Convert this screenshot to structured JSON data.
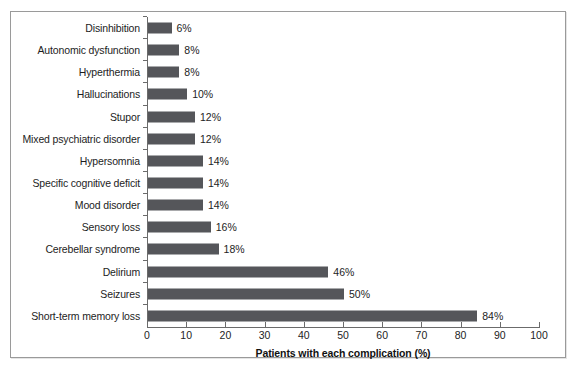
{
  "chart_data": {
    "type": "bar",
    "orientation": "horizontal",
    "title": "",
    "xlabel": "Patients with each complication (%)",
    "ylabel": "",
    "xlim": [
      0,
      100
    ],
    "xticks": [
      0,
      10,
      20,
      30,
      40,
      50,
      60,
      70,
      80,
      90,
      100
    ],
    "grid": false,
    "legend": null,
    "bar_color": "#55565a",
    "categories": [
      "Disinhibition",
      "Autonomic dysfunction",
      "Hyperthermia",
      "Hallucinations",
      "Stupor",
      "Mixed psychiatric disorder",
      "Hypersomnia",
      "Specific cognitive deficit",
      "Mood disorder",
      "Sensory loss",
      "Cerebellar syndrome",
      "Delirium",
      "Seizures",
      "Short-term memory loss"
    ],
    "values": [
      6,
      8,
      8,
      10,
      12,
      12,
      14,
      14,
      14,
      16,
      18,
      46,
      50,
      84
    ],
    "data_labels": [
      "6%",
      "8%",
      "8%",
      "10%",
      "12%",
      "12%",
      "14%",
      "14%",
      "14%",
      "16%",
      "18%",
      "46%",
      "50%",
      "84%"
    ]
  }
}
